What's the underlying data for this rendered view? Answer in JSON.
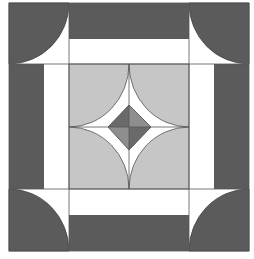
{
  "figure": {
    "colors": {
      "background": "#ffffff",
      "dark": "#5b5b5b",
      "light": "#c6c6c6",
      "diamond_dark": "#6a6a6a",
      "diamond_light": "#8e8e8e",
      "stroke": "#444444"
    },
    "outer": {
      "x0": 9,
      "y0": 3,
      "x1": 249,
      "y1": 251
    },
    "grid": {
      "xs": [
        9,
        69,
        189,
        249
      ],
      "ys": [
        3,
        64,
        189,
        251
      ]
    },
    "bands": {
      "dark_depth": 36,
      "white_depth": 25
    },
    "center": {
      "cx": 129,
      "cy": 127
    },
    "diamond": {
      "top": 105,
      "bottom": 150,
      "left": 108,
      "right": 151
    }
  }
}
